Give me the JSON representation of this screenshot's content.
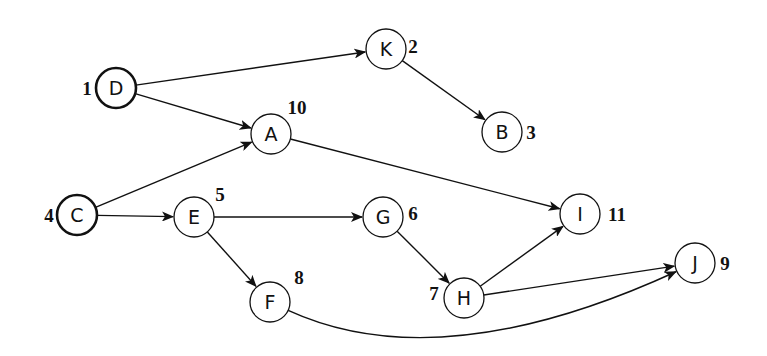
{
  "diagram": {
    "type": "directed-graph",
    "nodes": [
      {
        "id": "D",
        "label": "D",
        "order": "1",
        "x": 116,
        "y": 88,
        "bold": true,
        "order_dx": -29,
        "order_dy": 0
      },
      {
        "id": "K",
        "label": "K",
        "order": "2",
        "x": 386,
        "y": 49,
        "bold": false,
        "order_dx": 27,
        "order_dy": -3
      },
      {
        "id": "B",
        "label": "B",
        "order": "3",
        "x": 502,
        "y": 132,
        "bold": false,
        "order_dx": 29,
        "order_dy": 0
      },
      {
        "id": "A",
        "label": "A",
        "order": "10",
        "x": 271,
        "y": 134,
        "bold": false,
        "order_dx": 26,
        "order_dy": -27
      },
      {
        "id": "C",
        "label": "C",
        "order": "4",
        "x": 77,
        "y": 215,
        "bold": true,
        "order_dx": -28,
        "order_dy": 0
      },
      {
        "id": "E",
        "label": "E",
        "order": "5",
        "x": 194,
        "y": 217,
        "bold": false,
        "order_dx": 26,
        "order_dy": -23
      },
      {
        "id": "G",
        "label": "G",
        "order": "6",
        "x": 383,
        "y": 217,
        "bold": false,
        "order_dx": 30,
        "order_dy": -4
      },
      {
        "id": "I",
        "label": "I",
        "order": "11",
        "x": 580,
        "y": 214,
        "bold": false,
        "order_dx": 37,
        "order_dy": 0
      },
      {
        "id": "H",
        "label": "H",
        "order": "7",
        "x": 464,
        "y": 298,
        "bold": false,
        "order_dx": -30,
        "order_dy": -5
      },
      {
        "id": "F",
        "label": "F",
        "order": "8",
        "x": 270,
        "y": 302,
        "bold": false,
        "order_dx": 29,
        "order_dy": -25
      },
      {
        "id": "J",
        "label": "J",
        "order": "9",
        "x": 695,
        "y": 263,
        "bold": false,
        "order_dx": 30,
        "order_dy": 0
      }
    ],
    "edges": [
      {
        "from": "D",
        "to": "K"
      },
      {
        "from": "D",
        "to": "A"
      },
      {
        "from": "K",
        "to": "B"
      },
      {
        "from": "C",
        "to": "A"
      },
      {
        "from": "C",
        "to": "E"
      },
      {
        "from": "A",
        "to": "I"
      },
      {
        "from": "E",
        "to": "G"
      },
      {
        "from": "E",
        "to": "F"
      },
      {
        "from": "G",
        "to": "H"
      },
      {
        "from": "H",
        "to": "I"
      },
      {
        "from": "H",
        "to": "J"
      },
      {
        "from": "F",
        "to": "J",
        "curved": true,
        "control": [
          440,
          380
        ]
      }
    ],
    "node_radius": 20,
    "colors": {
      "stroke": "#111111",
      "background": "#ffffff"
    }
  }
}
